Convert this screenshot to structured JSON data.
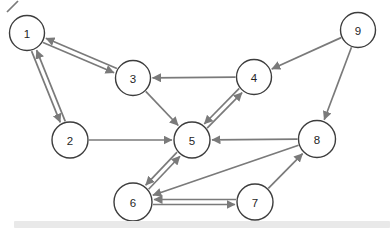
{
  "graph": {
    "background": "#ffffff",
    "edge_color": "#7a7a7a",
    "edge_width": 1.7,
    "node_fill": "#ffffff",
    "node_stroke": "#3d3d3d",
    "node_stroke_width": 1.4,
    "label_color": "#1f1f1f",
    "nodes": [
      {
        "id": "1",
        "label": "1",
        "x": 27,
        "y": 33,
        "r": 17.5
      },
      {
        "id": "2",
        "label": "2",
        "x": 70,
        "y": 140,
        "r": 18
      },
      {
        "id": "3",
        "label": "3",
        "x": 133,
        "y": 78,
        "r": 17.5
      },
      {
        "id": "4",
        "label": "4",
        "x": 254,
        "y": 77,
        "r": 17.5
      },
      {
        "id": "5",
        "label": "5",
        "x": 192,
        "y": 140,
        "r": 18
      },
      {
        "id": "6",
        "label": "6",
        "x": 133,
        "y": 202,
        "r": 19
      },
      {
        "id": "7",
        "label": "7",
        "x": 255,
        "y": 202,
        "r": 18
      },
      {
        "id": "8",
        "label": "8",
        "x": 317,
        "y": 139,
        "r": 18.5
      },
      {
        "id": "9",
        "label": "9",
        "x": 358,
        "y": 30,
        "r": 17.5
      }
    ],
    "edges": [
      {
        "from": "1",
        "to": "3",
        "offset": -2.5
      },
      {
        "from": "3",
        "to": "1",
        "offset": -2.5
      },
      {
        "from": "1",
        "to": "2",
        "offset": -2.5
      },
      {
        "from": "2",
        "to": "1",
        "offset": -2.5
      },
      {
        "from": "4",
        "to": "3",
        "offset": 0
      },
      {
        "from": "9",
        "to": "4",
        "offset": 0
      },
      {
        "from": "9",
        "to": "8",
        "offset": 0
      },
      {
        "from": "2",
        "to": "5",
        "offset": 0
      },
      {
        "from": "3",
        "to": "5",
        "offset": 0
      },
      {
        "from": "4",
        "to": "5",
        "offset": -2.5
      },
      {
        "from": "5",
        "to": "4",
        "offset": -2.5
      },
      {
        "from": "8",
        "to": "5",
        "offset": 0
      },
      {
        "from": "5",
        "to": "6",
        "offset": -2.5
      },
      {
        "from": "6",
        "to": "5",
        "offset": -2.5
      },
      {
        "from": "8",
        "to": "6",
        "offset": 0
      },
      {
        "from": "7",
        "to": "8",
        "offset": 0
      },
      {
        "from": "7",
        "to": "6",
        "offset": -2.5
      },
      {
        "from": "6",
        "to": "7",
        "offset": -2.5
      }
    ]
  },
  "decorations": {
    "artifact_stroke": {
      "x1": 7,
      "y1": 12,
      "x2": 18,
      "y2": 1
    },
    "scrollbar": {
      "x": 14,
      "y": 221,
      "width": 376,
      "height": 7,
      "color": "#e9e9e9"
    }
  }
}
